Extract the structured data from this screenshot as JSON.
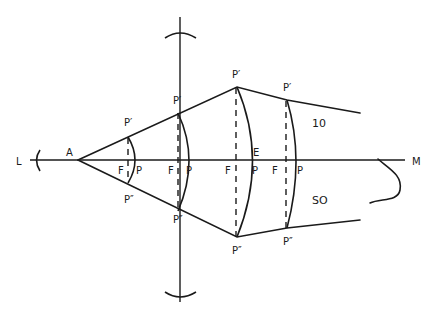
{
  "diagram": {
    "type": "optics-wavefront",
    "axis": {
      "left_label": "L",
      "right_label": "M"
    },
    "source_label": "A",
    "wavefronts": [
      {
        "top": "P′",
        "bottom": "P″",
        "focus": "F",
        "pole": "P"
      },
      {
        "top": "P′",
        "bottom": "P″",
        "focus": "F",
        "pole": "P"
      },
      {
        "top": "P′",
        "bottom": "P″",
        "focus": "F",
        "pole": "P",
        "extra": "E"
      },
      {
        "top": "P′",
        "bottom": "P″",
        "focus": "F",
        "pole": "P"
      }
    ],
    "region_labels": {
      "upper": "10",
      "lower": "SO"
    },
    "colors": {
      "ink": "#1a1a1a",
      "background": "#ffffff"
    }
  }
}
